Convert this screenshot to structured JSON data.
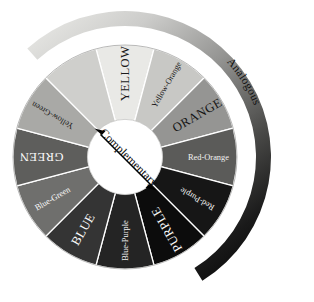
{
  "diagram": {
    "center_label": "Complementary",
    "outer_arc_label": "Analogous",
    "geometry": {
      "center_x": 125,
      "center_y": 157,
      "outer_radius": 112,
      "inner_radius": 37,
      "segment_count": 12,
      "segment_span_degrees": 30
    },
    "segments": [
      {
        "label": "YELLOW",
        "style": "caps",
        "angle": 0,
        "fill": "#e9e9e6",
        "text_color": "#1a1a1a"
      },
      {
        "label": "Yellow-Orange",
        "style": "regular",
        "angle": 30,
        "fill": "#c8c8c5",
        "text_color": "#1a1a1a"
      },
      {
        "label": "ORANGE",
        "style": "caps",
        "angle": 60,
        "fill": "#959593",
        "text_color": "#141414"
      },
      {
        "label": "Red-Orange",
        "style": "regular",
        "angle": 90,
        "fill": "#5b5b59",
        "text_color": "#f2f2f2"
      },
      {
        "label": "Red-Purple",
        "style": "regular",
        "angle": 120,
        "fill": "#161616",
        "text_color": "#f5f5f5"
      },
      {
        "label": "PURPLE",
        "style": "caps",
        "angle": 150,
        "fill": "#0c0c0c",
        "text_color": "#f7f7f7"
      },
      {
        "label": "Blue-Purple",
        "style": "regular",
        "angle": 180,
        "fill": "#242424",
        "text_color": "#f2f2f2"
      },
      {
        "label": "BLUE",
        "style": "caps",
        "angle": 210,
        "fill": "#343434",
        "text_color": "#fafafa"
      },
      {
        "label": "Blue-Green",
        "style": "regular",
        "angle": 240,
        "fill": "#6f6f6d",
        "text_color": "#fafafa"
      },
      {
        "label": "GREEN",
        "style": "caps",
        "angle": 270,
        "fill": "#5e5e5c",
        "text_color": "#fafafa"
      },
      {
        "label": "Yellow-Green",
        "style": "regular",
        "angle": 300,
        "fill": "#a9a9a6",
        "text_color": "#1a1a1a"
      },
      {
        "label": "",
        "style": "regular",
        "angle": 330,
        "fill": "#cfcfcc",
        "text_color": "#1a1a1a"
      }
    ],
    "outer_arc": {
      "gradient_start": "#e2e2df",
      "gradient_mid": "#8f8f8d",
      "gradient_end": "#0b0b0b",
      "start_angle": -42,
      "end_angle": 148
    },
    "complementary_arrow": {
      "from": "upper-left",
      "to": "lower-right",
      "color": "#000000",
      "double_headed": true
    },
    "separator_color": "#ffffff",
    "background": "#ffffff"
  }
}
